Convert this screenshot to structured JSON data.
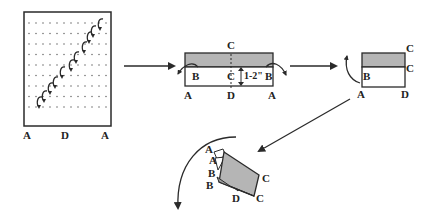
{
  "diagram": {
    "type": "folding-instructions",
    "colors": {
      "line": "#2a2a2a",
      "shade": "#b5b5b5",
      "paper": "#ffffff"
    },
    "step1": {
      "labels": {
        "bottom_left": "A",
        "bottom_mid": "D",
        "bottom_right": "A"
      },
      "description": "dotted grid paper with diagonal series of curl (roll) arrows"
    },
    "step2": {
      "labels": {
        "top": "C",
        "middle": "C",
        "bottom_mid": "D",
        "bottom_left": "A",
        "bottom_right": "A",
        "fold_left": "B",
        "fold_right": "B",
        "measure": "1-2\""
      }
    },
    "step3": {
      "labels": {
        "top_right": "C",
        "mid_right": "C",
        "left": "B",
        "bottom_left": "A",
        "bottom_right": "D"
      }
    },
    "step4": {
      "labels": {
        "a1": "A",
        "a2": "A",
        "b1": "B",
        "b2": "B",
        "d": "D",
        "c1": "C",
        "c2": "C"
      }
    }
  }
}
